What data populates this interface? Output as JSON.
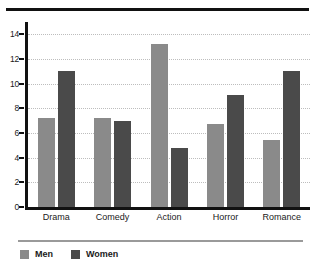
{
  "chart_data": {
    "type": "bar",
    "title": "",
    "subtitle": "",
    "xlabel": "",
    "ylabel": "",
    "categories": [
      "Drama",
      "Comedy",
      "Action",
      "Horror",
      "Romance"
    ],
    "series": [
      {
        "name": "Men",
        "color": "#8a8a8a",
        "values": [
          7.2,
          7.2,
          13.2,
          6.7,
          5.4
        ]
      },
      {
        "name": "Women",
        "color": "#4a4a4a",
        "values": [
          11.0,
          7.0,
          4.8,
          9.1,
          11.0
        ]
      }
    ],
    "ylim": [
      0,
      15
    ],
    "yticks": [
      0,
      2,
      4,
      6,
      8,
      10,
      12,
      14
    ],
    "ytick_labels": [
      "0",
      "2",
      "4",
      "6",
      "8",
      "10",
      "12",
      "14"
    ],
    "grid": true,
    "grid_style": "dotted",
    "grid_axis": "y",
    "legend_position": "bottom-left",
    "orientation": "vertical",
    "grouping": "grouped"
  },
  "legend": {
    "items": [
      {
        "label": "Men"
      },
      {
        "label": "Women"
      }
    ]
  }
}
